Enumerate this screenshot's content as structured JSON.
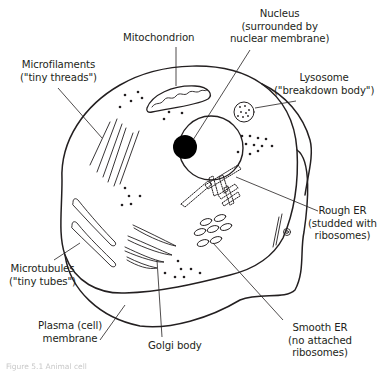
{
  "figure": {
    "subject": "Animal cell",
    "caption": "Figure 5.1 Animal cell"
  },
  "labels": {
    "mitochondrion": {
      "lines": [
        "Mitochondrion"
      ]
    },
    "nucleus": {
      "lines": [
        "Nucleus",
        "(surrounded by",
        "nuclear membrane)"
      ]
    },
    "microfilaments": {
      "lines": [
        "Microfilaments",
        "(\"tiny threads\")"
      ]
    },
    "lysosome": {
      "lines": [
        "Lysosome",
        "(\"breakdown body\")"
      ]
    },
    "rough_er": {
      "lines": [
        "Rough ER",
        "(studded with",
        "ribosomes)"
      ]
    },
    "microtubules": {
      "lines": [
        "Microtubules",
        "(\"tiny tubes\")"
      ]
    },
    "plasma_membrane": {
      "lines": [
        "Plasma (cell)",
        "membrane"
      ]
    },
    "golgi_body": {
      "lines": [
        "Golgi body"
      ]
    },
    "smooth_er": {
      "lines": [
        "Smooth ER",
        "(no attached",
        "ribosomes)"
      ]
    }
  },
  "colors": {
    "ink": "#231f20",
    "background": "#ffffff",
    "nucleolus": "#000000"
  }
}
